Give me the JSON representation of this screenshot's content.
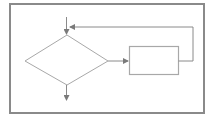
{
  "diagram": {
    "type": "flowchart",
    "colors": {
      "frame": "#8a8a8a",
      "shape_stroke": "#a8a8a8",
      "arrow": "#8a8a8a",
      "background": "#ffffff"
    },
    "nodes": [
      {
        "id": "entry",
        "kind": "arrow-in",
        "label": ""
      },
      {
        "id": "decision",
        "kind": "diamond",
        "label": ""
      },
      {
        "id": "process",
        "kind": "rectangle",
        "label": ""
      },
      {
        "id": "exit",
        "kind": "arrow-out",
        "label": ""
      }
    ],
    "edges": [
      {
        "from": "entry",
        "to": "decision",
        "label": ""
      },
      {
        "from": "decision",
        "to": "process",
        "label": ""
      },
      {
        "from": "process",
        "to": "decision",
        "label": "",
        "route": "loop-back-over-top"
      },
      {
        "from": "decision",
        "to": "exit",
        "label": ""
      }
    ]
  }
}
